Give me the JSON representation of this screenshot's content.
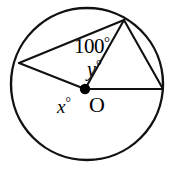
{
  "diagram": {
    "type": "circle-geometry",
    "background_color": "#ffffff",
    "stroke_color": "#000000",
    "circle": {
      "center_label": "O",
      "center_x": 87,
      "center_y": 84,
      "radius": 76,
      "stroke_width": 2.4
    },
    "center_dot": {
      "x": 85,
      "y": 89,
      "radius": 5.2,
      "fill": "#000000"
    },
    "points": [
      {
        "name": "A",
        "x": 19,
        "y": 63
      },
      {
        "name": "B",
        "x": 124,
        "y": 20
      },
      {
        "name": "C",
        "x": 163,
        "y": 89
      }
    ],
    "segments": [
      {
        "name": "chord-A-B",
        "x1": 19,
        "y1": 63,
        "x2": 124,
        "y2": 20,
        "stroke_width": 2.1
      },
      {
        "name": "chord-B-C",
        "x1": 124,
        "y1": 20,
        "x2": 163,
        "y2": 89,
        "stroke_width": 2.1
      },
      {
        "name": "radius-O-A",
        "x1": 85,
        "y1": 89,
        "x2": 19,
        "y2": 63,
        "stroke_width": 2.1
      },
      {
        "name": "radius-O-C",
        "x1": 85,
        "y1": 89,
        "x2": 163,
        "y2": 89,
        "stroke_width": 2.1
      },
      {
        "name": "segment-O-B",
        "x1": 85,
        "y1": 89,
        "x2": 124,
        "y2": 20,
        "stroke_width": 2.1
      }
    ],
    "labels": {
      "inscribed_angle": "100",
      "inscribed_angle_full": "100°",
      "central_angle_upper": "y",
      "central_angle_upper_full": "y°",
      "central_angle_lower": "x",
      "central_angle_lower_full": "x°",
      "degree_symbol": "°",
      "center_point": "O"
    }
  }
}
